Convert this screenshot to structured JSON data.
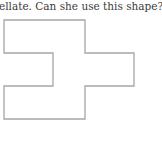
{
  "question": {
    "text": "ellate. Can she use this shape?"
  },
  "figure": {
    "name": "tessellation-candidate-shape",
    "stroke_color": "#a6a6a6",
    "points": "4,20 85,20 85,53 134,53 134,86 85,86 85,119 4,119 4,86 53,86 53,53 4,53"
  }
}
